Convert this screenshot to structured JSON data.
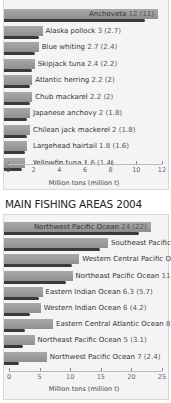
{
  "chart_data": [
    {
      "type": "bar",
      "orientation": "horizontal",
      "title": "",
      "categories": [
        "Anchoveta",
        "Alaska pollock",
        "Blue whiting",
        "Skipjack tuna",
        "Atlantic herring",
        "Chub mackarel",
        "Japanese anchovy",
        "Chilean jack mackerel",
        "Largehead hairtail",
        "Yellowfin tuna"
      ],
      "series": [
        {
          "name": "Million tons",
          "values": [
            12,
            3,
            2.7,
            2.4,
            2.2,
            2.2,
            2,
            2,
            1.8,
            1.6
          ]
        },
        {
          "name": "Million tons (parenthetical)",
          "values": [
            11,
            2.7,
            2.4,
            2.2,
            2,
            2,
            1.8,
            1.8,
            1.6,
            1.4
          ]
        }
      ],
      "labels": [
        "Anchoveta 12 (11)",
        "Alaska pollock 3 (2.7)",
        "Blue whiting 2.7 (2.4)",
        "Skipjack tuna 2.4 (2.2)",
        "Atlantic herring 2.2 (2)",
        "Chub mackarel 2.2 (2)",
        "Japanese anchovy 2 (1.8)",
        "Chilean jack mackerel 2 (1.8)",
        "Largehead hairtail 1.8 (1.6)",
        "Yellowfin tuna 1.6 (1.4)"
      ],
      "xlabel": "Million tons (million t)",
      "ylabel": "",
      "xlim": [
        0,
        12
      ],
      "xticks": [
        "0",
        "2",
        "4",
        "6",
        "8",
        "10",
        "12"
      ],
      "grid": false,
      "legend": null
    },
    {
      "type": "bar",
      "orientation": "horizontal",
      "title": "MAIN FISHING AREAS 2004",
      "categories": [
        "Northwest Pacific Ocean",
        "Southeast Pacific Ocean",
        "Western Central Pacific Ocean",
        "Northeast Pacific Ocean",
        "Eastern Indian Ocean",
        "Western Indian Ocean",
        "Eastern Central Atlantic Ocean",
        "Northeast Pacific Ocean",
        "Northwest Pacific Ocean"
      ],
      "series": [
        {
          "name": "Million tons",
          "values": [
            24,
            17,
            12.3,
            11.2,
            6.3,
            6,
            8,
            5,
            7
          ]
        },
        {
          "name": "Million tons (parenthetical)",
          "values": [
            22,
            15.7,
            11.1,
            10.1,
            5.7,
            4.2,
            3.5,
            3.1,
            2.4
          ]
        }
      ],
      "labels": [
        "Northwest Pacific Ocean 24 (22)",
        "Southeast Pacific Ocean 17 (15.7)",
        "Western Central Pacific Ocean 12.3 (11.1)",
        "Northeast Pacific Ocean 11.2 (10.1)",
        "Eastern Indian Ocean 6.3 (5.7)",
        "Western Indian Ocean 6 (4.2)",
        "Eastern Central Atlantic Ocean 8 (3.5)",
        "Northeast Pacific Ocean 5 (3.1)",
        "Northwest Pacific Ocean 7 (2.4)"
      ],
      "xlabel": "Million tons (million t)",
      "ylabel": "",
      "xlim": [
        0,
        25
      ],
      "xticks": [
        "0",
        "5",
        "10",
        "15",
        "20",
        "25"
      ],
      "grid": false,
      "legend": null
    }
  ],
  "chart1": {
    "title_clipped": "SPECIES 2004",
    "rows": [
      {
        "name": "Anchoveta",
        "value": "12 (11)"
      },
      {
        "name": "Alaska pollock",
        "value": "3 (2.7)"
      },
      {
        "name": "Blue whiting",
        "value": "2.7 (2.4)"
      },
      {
        "name": "Skipjack tuna",
        "value": "2.4 (2.2)"
      },
      {
        "name": "Atlantic herring",
        "value": "2.2 (2)"
      },
      {
        "name": "Chub mackarel",
        "value": "2.2 (2)"
      },
      {
        "name": "Japanese anchovy",
        "value": "2 (1.8)"
      },
      {
        "name": "Chilean jack mackerel",
        "value": "2 (1.8)"
      },
      {
        "name": "Largehead hairtail",
        "value": "1.8 (1.6)"
      },
      {
        "name": "Yellowfin tuna",
        "value": "1.6 (1.4)"
      }
    ],
    "ticks": [
      "0",
      "2",
      "4",
      "6",
      "8",
      "10",
      "12"
    ],
    "xlabel": "Million tons (million t)"
  },
  "chart2": {
    "title": "MAIN FISHING AREAS 2004",
    "rows": [
      {
        "name": "Northwest Pacific Ocean",
        "value": "24 (22)"
      },
      {
        "name": "Southeast Pacific Ocean",
        "value": "17 (15.7)"
      },
      {
        "name": "Western Central Pacific Ocean",
        "value": "12.3 (11.1)"
      },
      {
        "name": "Northeast Pacific Ocean",
        "value": "11.2 (10.1)"
      },
      {
        "name": "Eastern Indian Ocean",
        "value": "6.3 (5.7)"
      },
      {
        "name": "Western Indian Ocean",
        "value": "6 (4.2)"
      },
      {
        "name": "Eastern Central Atlantic Ocean",
        "value": "8 (3.5)"
      },
      {
        "name": "Northeast Pacific Ocean",
        "value": "5 (3.1)"
      },
      {
        "name": "Northwest Pacific Ocean",
        "value": "7 (2.4)"
      }
    ],
    "ticks": [
      "0",
      "5",
      "10",
      "15",
      "20",
      "25"
    ],
    "xlabel": "Million tons (million t)"
  },
  "colors": {
    "bar": "#9a9a9a",
    "bar_dark": "#3a3a3a",
    "panel": "#f4f4f4"
  }
}
